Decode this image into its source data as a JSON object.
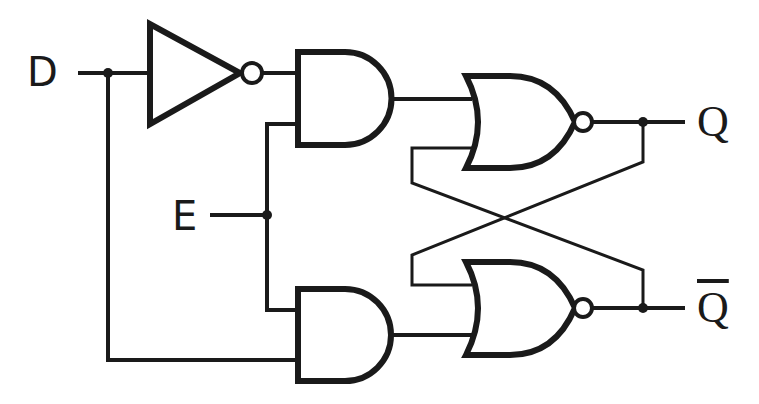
{
  "diagram": {
    "type": "logic-circuit",
    "inputs": [
      {
        "id": "D",
        "label": "D"
      },
      {
        "id": "E",
        "label": "E"
      }
    ],
    "outputs": [
      {
        "id": "Q",
        "label": "Q"
      },
      {
        "id": "Qbar",
        "label": "Q"
      }
    ],
    "gates": [
      {
        "id": "not1",
        "type": "NOT",
        "inputs": [
          "D"
        ]
      },
      {
        "id": "and_top",
        "type": "AND",
        "inputs": [
          "not1",
          "E"
        ]
      },
      {
        "id": "and_bottom",
        "type": "AND",
        "inputs": [
          "E",
          "D"
        ]
      },
      {
        "id": "nor_top",
        "type": "NOR",
        "inputs": [
          "and_top",
          "nor_bottom"
        ],
        "output": "Q"
      },
      {
        "id": "nor_bottom",
        "type": "NOR",
        "inputs": [
          "nor_top",
          "and_bottom"
        ],
        "output": "Qbar"
      }
    ],
    "colors": {
      "stroke": "#1a1a1a",
      "background": "#ffffff"
    }
  }
}
